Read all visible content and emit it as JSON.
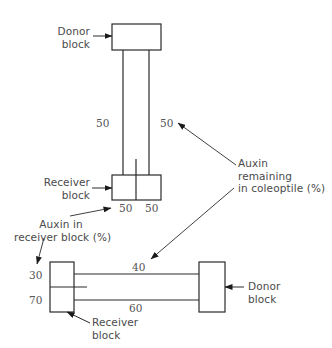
{
  "colors": {
    "line": "#2a2a2a",
    "text": "#4a4a4a",
    "background": "#ffffff"
  },
  "vertical_setup": {
    "donor_block_label": [
      "Donor",
      "block"
    ],
    "receiver_block_label": [
      "Receiver",
      "block"
    ],
    "coleoptile_left_value": "50",
    "coleoptile_right_value": "50",
    "receiver_left_value": "50",
    "receiver_right_value": "50"
  },
  "horizontal_setup": {
    "donor_block_label": [
      "Donor",
      "block"
    ],
    "receiver_block_label": [
      "Receiver",
      "block"
    ],
    "receiver_top_value": "30",
    "receiver_bottom_value": "70",
    "coleoptile_top_value": "40",
    "coleoptile_bottom_value": "60"
  },
  "annotations": {
    "auxin_remaining": [
      "Auxin",
      "remaining",
      "in coleoptile (%)"
    ],
    "auxin_receiver": [
      "Auxin in",
      "receiver block (%)"
    ]
  }
}
